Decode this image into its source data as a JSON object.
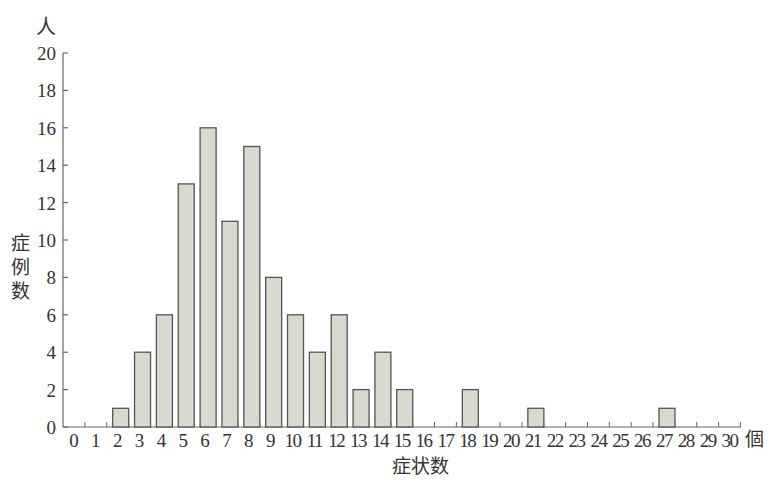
{
  "chart_data": {
    "type": "bar",
    "title": "",
    "xlabel": "症状数",
    "x_unit": "個",
    "ylabel": "症例数",
    "y_unit": "人",
    "categories": [
      "0",
      "1",
      "2",
      "3",
      "4",
      "5",
      "6",
      "7",
      "8",
      "9",
      "10",
      "11",
      "12",
      "13",
      "14",
      "15",
      "16",
      "17",
      "18",
      "19",
      "20",
      "21",
      "22",
      "23",
      "24",
      "25",
      "26",
      "27",
      "28",
      "29",
      "30"
    ],
    "values": [
      0,
      0,
      1,
      4,
      6,
      13,
      16,
      11,
      15,
      8,
      6,
      4,
      6,
      2,
      4,
      2,
      0,
      0,
      2,
      0,
      0,
      1,
      0,
      0,
      0,
      0,
      0,
      1,
      0,
      0,
      0
    ],
    "ylim": [
      0,
      20
    ],
    "yticks": [
      0,
      2,
      4,
      6,
      8,
      10,
      12,
      14,
      16,
      18,
      20
    ],
    "grid": false,
    "legend": null,
    "colors": {
      "bar_fill": "#d9d9d0",
      "bar_stroke": "#555555",
      "axis": "#666666"
    }
  }
}
